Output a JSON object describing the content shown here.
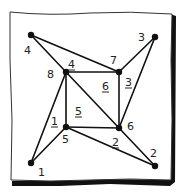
{
  "diagram": {
    "type": "graph",
    "nodes": [
      {
        "id": "n1",
        "label": "1",
        "x": 31,
        "y": 163,
        "label_x": 38,
        "label_y": 176
      },
      {
        "id": "n2",
        "label": "2",
        "x": 155,
        "y": 166,
        "label_x": 150,
        "label_y": 157
      },
      {
        "id": "n3",
        "label": "3",
        "x": 155,
        "y": 37,
        "label_x": 138,
        "label_y": 41
      },
      {
        "id": "n4",
        "label": "4",
        "x": 31,
        "y": 35,
        "label_x": 24,
        "label_y": 54
      },
      {
        "id": "n5",
        "label": "5",
        "x": 66,
        "y": 127,
        "label_x": 62,
        "label_y": 143
      },
      {
        "id": "n6",
        "label": "6",
        "x": 119,
        "y": 128,
        "label_x": 127,
        "label_y": 130
      },
      {
        "id": "n7",
        "label": "7",
        "x": 119,
        "y": 72,
        "label_x": 110,
        "label_y": 64
      },
      {
        "id": "n8",
        "label": "8",
        "x": 66,
        "y": 72,
        "label_x": 47,
        "label_y": 78
      }
    ],
    "edges": [
      {
        "from": "n4",
        "to": "n8"
      },
      {
        "from": "n4",
        "to": "n7"
      },
      {
        "from": "n3",
        "to": "n7"
      },
      {
        "from": "n3",
        "to": "n6"
      },
      {
        "from": "n2",
        "to": "n6"
      },
      {
        "from": "n2",
        "to": "n5"
      },
      {
        "from": "n1",
        "to": "n5"
      },
      {
        "from": "n1",
        "to": "n8"
      },
      {
        "from": "n8",
        "to": "n7"
      },
      {
        "from": "n7",
        "to": "n6"
      },
      {
        "from": "n6",
        "to": "n5"
      },
      {
        "from": "n5",
        "to": "n8"
      },
      {
        "from": "n8",
        "to": "n6"
      }
    ],
    "edge_labels": [
      {
        "label": "4",
        "x": 68,
        "y": 68,
        "underlined": true
      },
      {
        "label": "3",
        "x": 125,
        "y": 86,
        "underlined": true
      },
      {
        "label": "2",
        "x": 112,
        "y": 146,
        "underlined": true
      },
      {
        "label": "1",
        "x": 51,
        "y": 125,
        "underlined": true
      }
    ],
    "face_labels": [
      {
        "label": "6",
        "x": 102,
        "y": 90,
        "underlined": true
      },
      {
        "label": "5",
        "x": 75,
        "y": 115,
        "underlined": true
      }
    ],
    "colors": {
      "ink": "#111111",
      "paper": "#ffffff",
      "shadow": "#111111"
    }
  }
}
